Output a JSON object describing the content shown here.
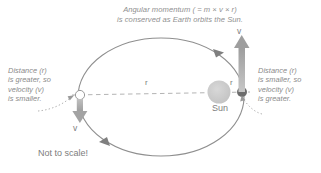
{
  "diagram": {
    "title_line1": "Angular momentum ( = m × v × r)",
    "title_line2": "is conserved as Earth orbits the Sun.",
    "title_full": "Angular momentum ( = m × v × r)\nis conserved as Earth orbits the Sun.",
    "footnote": "Not to scale!",
    "sun_label": "Sun",
    "labels": {
      "left_annotation": "Distance (r)\nis greater, so\nvelocity (v)\nis smaller.",
      "right_annotation": "Distance (r)\nis smaller, so\nvelocity (v)\nis greater."
    },
    "markers": {
      "radius_left": "r",
      "radius_right": "r",
      "velocity_aphelion": "v",
      "velocity_perihelion": "v"
    },
    "colors": {
      "text_gray": "#8a8a8a",
      "dark_text": "#7d7d7d",
      "orbit_stroke": "#8f8f8f",
      "sun_fill": "#c9c9c9",
      "earth_fill": "#6d6d6d",
      "aphelion_fill": "#ffffff",
      "arrow_gray": "#a8a8a8",
      "dashed_gray": "#b4b4b4",
      "background": "#ffffff"
    },
    "geometry": {
      "orbit_center_x": 161,
      "orbit_center_y": 97,
      "orbit_rx": 83,
      "orbit_ry": 59,
      "sun_x": 219,
      "sun_y": 92,
      "sun_r": 11,
      "earth_x": 242,
      "earth_y": 92,
      "earth_r": 5,
      "aphelion_x": 80,
      "aphelion_y": 95,
      "aphelion_r": 4.5
    }
  }
}
